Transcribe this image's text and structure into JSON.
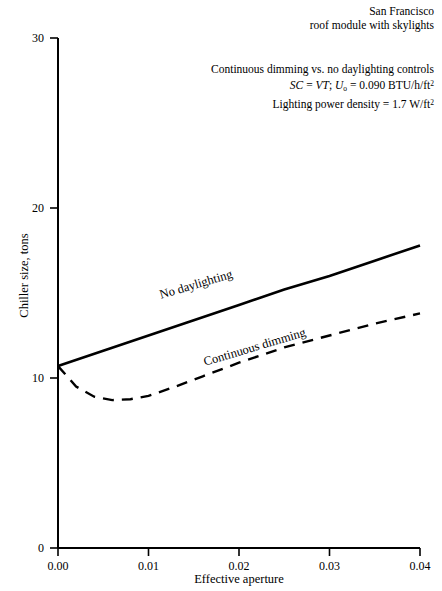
{
  "header": {
    "line1": "San Francisco",
    "line2": "roof module with skylights"
  },
  "annotation": {
    "line1": "Continuous dimming vs. no daylighting controls",
    "line2_sc": "SC",
    "line2_eq1": " = ",
    "line2_vt": "VT",
    "line2_semi": "; ",
    "line2_u": "U",
    "line2_usub": "o",
    "line2_eq2": " = ",
    "line2_val": "0.090 BTU/h/ft",
    "line2_sup": "2",
    "line3_text": "Lighting power density  =  1.7 W/ft",
    "line3_sup": "2"
  },
  "chart_data": {
    "type": "line",
    "title": "",
    "xlabel": "Effective aperture",
    "ylabel": "Chiller size, tons",
    "xlim": [
      0.0,
      0.04
    ],
    "ylim": [
      0,
      30
    ],
    "xticks": [
      "0.00",
      "0.01",
      "0.02",
      "0.03",
      "0.04"
    ],
    "xtick_values": [
      0.0,
      0.01,
      0.02,
      0.03,
      0.04
    ],
    "yticks": [
      "0",
      "10",
      "20",
      "30"
    ],
    "ytick_values": [
      0,
      10,
      20,
      30
    ],
    "grid": false,
    "legend": "inline-labels",
    "series": [
      {
        "name": "No daylighting",
        "style": "solid",
        "color": "#000000",
        "x": [
          0.0,
          0.005,
          0.01,
          0.015,
          0.02,
          0.025,
          0.03,
          0.035,
          0.04
        ],
        "values": [
          10.7,
          11.6,
          12.5,
          13.4,
          14.3,
          15.2,
          16.0,
          16.9,
          17.8
        ]
      },
      {
        "name": "Continuous dimming",
        "style": "dashed",
        "color": "#000000",
        "x": [
          0.0,
          0.002,
          0.004,
          0.006,
          0.008,
          0.01,
          0.013,
          0.016,
          0.02,
          0.025,
          0.03,
          0.035,
          0.04
        ],
        "values": [
          10.7,
          9.5,
          8.9,
          8.7,
          8.75,
          8.95,
          9.5,
          10.1,
          10.9,
          11.8,
          12.5,
          13.2,
          13.8
        ]
      }
    ],
    "annotations": [
      "San Francisco",
      "roof module with skylights",
      "Continuous dimming vs. no daylighting controls",
      "SC = VT; Uo = 0.090 BTU/h/ft2",
      "Lighting power density = 1.7 W/ft2"
    ]
  },
  "curve_labels": {
    "no_daylighting": "No daylighting",
    "continuous_dimming": "Continuous dimming"
  },
  "colors": {
    "background": "#ffffff",
    "axis": "#000000",
    "line": "#000000"
  }
}
